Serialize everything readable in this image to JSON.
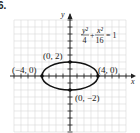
{
  "problem_label": "6.",
  "chart_data": {
    "type": "line",
    "title": "",
    "equation": {
      "term1_num": "y²",
      "term1_den": "4",
      "plus": "+",
      "term2_num": "x²",
      "term2_den": "16",
      "rhs": "= 1"
    },
    "xlabel": "x",
    "ylabel": "y",
    "xlim": [
      -8,
      8
    ],
    "ylim": [
      -8,
      8
    ],
    "grid": true,
    "curve": {
      "shape": "ellipse",
      "center": [
        0,
        0
      ],
      "semi_major_x": 4,
      "semi_minor_y": 2
    },
    "points": [
      {
        "x": 0,
        "y": 2,
        "label": "(0, 2)"
      },
      {
        "x": -4,
        "y": 0,
        "label": "(−4, 0)"
      },
      {
        "x": 4,
        "y": 0,
        "label": "(4, 0)"
      },
      {
        "x": 0,
        "y": -2,
        "label": "(0, −2)"
      }
    ]
  },
  "colors": {
    "grid": "#d8d8d8",
    "axis": "#222222",
    "curve": "#111111"
  }
}
